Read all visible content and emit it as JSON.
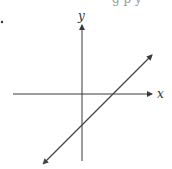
{
  "diagram": {
    "type": "coordinate-plane-with-line",
    "x_axis_label": "x",
    "y_axis_label": "y",
    "top_cut_text": "g p y",
    "colors": {
      "axes": "#3a3a3a",
      "line": "#444444",
      "background": "#ffffff"
    },
    "line": {
      "slope": "positive",
      "x_intercept": "positive",
      "y_intercept": "negative",
      "arrows": "both-ends"
    }
  }
}
